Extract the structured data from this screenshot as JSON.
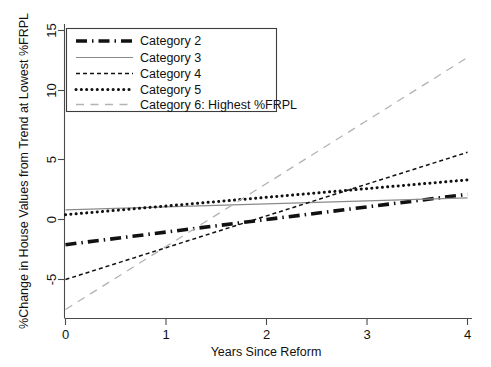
{
  "chart_data": {
    "type": "line",
    "title": "",
    "xlabel": "Years Since Reform",
    "ylabel": "%Change in House Values from Trend at Lowest %FRPL",
    "xlim": [
      0,
      4
    ],
    "ylim": [
      -7.9,
      16.2
    ],
    "xticks": [
      0,
      1,
      2,
      3,
      4
    ],
    "xtick_labels": [
      "0",
      "1",
      "2",
      "3",
      "4"
    ],
    "yticks": [
      -5,
      0,
      5,
      10,
      15
    ],
    "ytick_labels": [
      "-5",
      "0",
      "5",
      "10",
      "15"
    ],
    "grid": false,
    "legend_position": "upper-left-inside",
    "x": [
      0,
      1,
      2,
      3,
      4
    ],
    "series": [
      {
        "name": "Category 2",
        "values": [
          -2.1,
          -1.05,
          0.0,
          1.05,
          2.1
        ],
        "style": "dash-dot",
        "color": "#111111",
        "width": 3.6
      },
      {
        "name": "Category 3",
        "values": [
          0.8,
          1.05,
          1.3,
          1.55,
          1.8
        ],
        "style": "solid",
        "color": "#8a8a8a",
        "width": 1.1
      },
      {
        "name": "Category 4",
        "values": [
          -5.0,
          -2.35,
          0.3,
          2.95,
          5.6
        ],
        "style": "dashed",
        "color": "#111111",
        "width": 1.5
      },
      {
        "name": "Category 5",
        "values": [
          0.4,
          1.125,
          1.85,
          2.575,
          3.3
        ],
        "style": "dotted",
        "color": "#111111",
        "width": 3.0
      },
      {
        "name": "Category 6: Highest %FRPL",
        "values": [
          -7.5,
          -2.25,
          3.0,
          8.25,
          13.5
        ],
        "style": "long-dash",
        "color": "#b3b3b3",
        "width": 1.3
      }
    ]
  },
  "axes": {
    "x_title": "Years Since Reform",
    "y_title": "%Change in House Values from Trend at Lowest %FRPL",
    "x_tick_0": "0",
    "x_tick_1": "1",
    "x_tick_2": "2",
    "x_tick_3": "3",
    "x_tick_4": "4",
    "y_tick_m5": "-5",
    "y_tick_0": "0",
    "y_tick_5": "5",
    "y_tick_10": "10",
    "y_tick_15": "15"
  },
  "legend": {
    "entries": [
      {
        "label": "Category 2"
      },
      {
        "label": "Category 3"
      },
      {
        "label": "Category 4"
      },
      {
        "label": "Category 5"
      },
      {
        "label": "Category 6: Highest %FRPL"
      }
    ]
  }
}
